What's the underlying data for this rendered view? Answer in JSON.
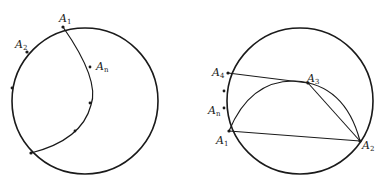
{
  "figures": [
    {
      "id": "left",
      "labels": {
        "a1": "A",
        "a1_sub": "1",
        "a2": "A",
        "a2_sub": "2",
        "an": "A",
        "an_sub": "n"
      }
    },
    {
      "id": "right",
      "labels": {
        "a1": "A",
        "a1_sub": "1",
        "a2": "A",
        "a2_sub": "2",
        "a3": "A",
        "a3_sub": "3",
        "a4": "A",
        "a4_sub": "4",
        "an": "A",
        "an_sub": "n"
      }
    }
  ],
  "colors": {
    "stroke": "#1a1a1a",
    "background": "#ffffff"
  }
}
